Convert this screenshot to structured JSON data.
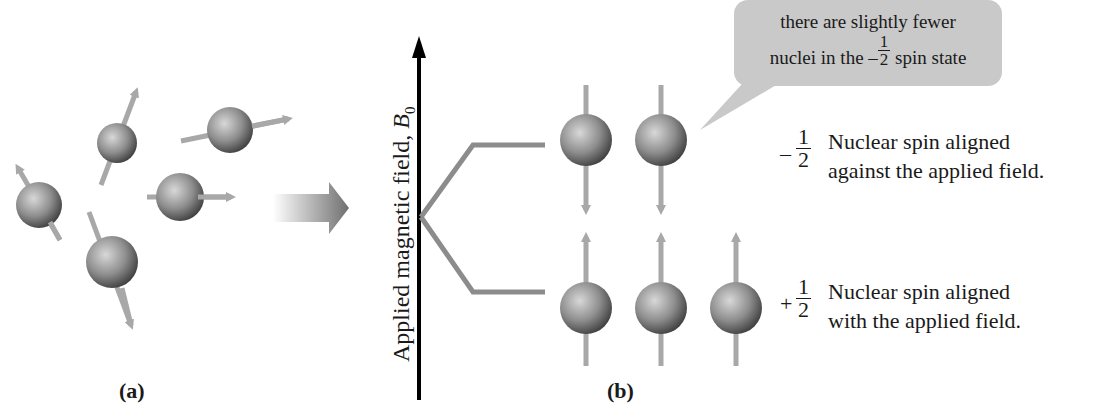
{
  "figure": {
    "panel_a": {
      "label": "(a)"
    },
    "panel_b": {
      "label": "(b)",
      "axis_label": "Applied magnetic field, ",
      "axis_symbol": "B",
      "axis_subscript": "0"
    },
    "callout": {
      "line1": "there are slightly fewer",
      "line2_prefix": "nuclei in the",
      "line2_sign": "–",
      "line2_num": "1",
      "line2_den": "2",
      "line2_suffix": "spin state"
    },
    "states": [
      {
        "sign": "–",
        "num": "1",
        "den": "2",
        "line1": "Nuclear spin aligned",
        "line2": "against the applied field.",
        "nuclei_count": 2,
        "arrow_direction": "down"
      },
      {
        "sign": "+",
        "num": "1",
        "den": "2",
        "line1": "Nuclear spin aligned",
        "line2": "with the applied field.",
        "nuclei_count": 3,
        "arrow_direction": "up"
      }
    ],
    "colors": {
      "background": "#ffffff",
      "sphere": "#8a8a8a",
      "spin_arrow": "#a8a8a8",
      "energy_line": "#8c8c8c",
      "callout_bg": "#c9c9c9",
      "axis": "#000000",
      "text": "#1a1a1a"
    }
  }
}
